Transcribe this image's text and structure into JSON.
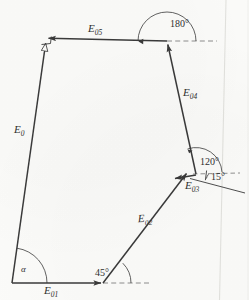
{
  "figure": {
    "type": "vector-polygon-diagram",
    "ink_color": "#3a3a3a",
    "paper_color": "#fbfbf9",
    "vectors": [
      {
        "id": "E0",
        "label": "E",
        "sub": "0",
        "from": [
          12,
          283
        ],
        "to": [
          46,
          41
        ],
        "arrow": "hollow",
        "arrow_at": "end"
      },
      {
        "id": "E01",
        "label": "E",
        "sub": "01",
        "from": [
          12,
          283
        ],
        "to": [
          103,
          283
        ],
        "arrow": "solid",
        "arrow_at": "end"
      },
      {
        "id": "E02",
        "label": "E",
        "sub": "02",
        "from": [
          103,
          283
        ],
        "to": [
          188,
          172
        ],
        "arrow": "solid",
        "arrow_at": "end"
      },
      {
        "id": "E03",
        "label": "E",
        "sub": "03",
        "from": [
          196,
          175
        ],
        "to": [
          172,
          179
        ],
        "arrow": "solid",
        "arrow_at": "end"
      },
      {
        "id": "E04",
        "label": "E",
        "sub": "04",
        "from": [
          196,
          174
        ],
        "to": [
          167,
          41
        ],
        "arrow": "solid",
        "arrow_at": "end"
      },
      {
        "id": "E05",
        "label": "E",
        "sub": "05",
        "from": [
          167,
          41
        ],
        "to": [
          46,
          38
        ],
        "arrow": "solid",
        "arrow_at": "end"
      }
    ],
    "labels": [
      {
        "name": "E0",
        "text": "E",
        "sub": "0",
        "x": 16,
        "y": 131
      },
      {
        "name": "E01",
        "text": "E",
        "sub": "01",
        "x": 45,
        "y": 286
      },
      {
        "name": "E02",
        "text": "E",
        "sub": "02",
        "x": 141,
        "y": 219
      },
      {
        "name": "E03",
        "text": "E",
        "sub": "03",
        "x": 187,
        "y": 181
      },
      {
        "name": "E04",
        "text": "E",
        "sub": "04",
        "x": 185,
        "y": 93
      },
      {
        "name": "E05",
        "text": "E",
        "sub": "05",
        "x": 91,
        "y": 28
      }
    ],
    "angles": [
      {
        "name": "alpha",
        "text": "α",
        "x": 22,
        "y": 268,
        "vertex": [
          12,
          283
        ],
        "arc": true
      },
      {
        "name": "45",
        "text": "45°",
        "x": 96,
        "y": 272,
        "vertex": [
          103,
          283
        ],
        "arc": true
      },
      {
        "name": "15",
        "text": "15°",
        "x": 214,
        "y": 178,
        "vertex": [
          196,
          174
        ],
        "arc": true
      },
      {
        "name": "120",
        "text": "120°",
        "x": 204,
        "y": 163,
        "vertex": [
          196,
          174
        ],
        "arc": true
      },
      {
        "name": "180",
        "text": "180°",
        "x": 174,
        "y": 23,
        "vertex": [
          167,
          41
        ],
        "arc": true
      }
    ],
    "reference_lines": [
      {
        "name": "baseline-dashed-45",
        "from": [
          103,
          283
        ],
        "to": [
          150,
          283
        ],
        "style": "dashed"
      },
      {
        "name": "baseline-dashed-180",
        "from": [
          167,
          41
        ],
        "to": [
          215,
          41
        ],
        "style": "dashed"
      },
      {
        "name": "baseline-dashed-15",
        "from": [
          196,
          174
        ],
        "to": [
          239,
          174
        ],
        "style": "dashed"
      },
      {
        "name": "slant-line-15",
        "from": [
          191,
          178
        ],
        "to": [
          243,
          192
        ],
        "style": "solid"
      }
    ],
    "markers": [
      {
        "name": "right-angle-square",
        "at": [
          46,
          41
        ],
        "note": "square marker at E05/E0 junction"
      }
    ],
    "artifacts": [
      {
        "name": "scan-edge-line",
        "from": [
          226,
          0
        ],
        "to": [
          219,
          300
        ]
      }
    ]
  }
}
